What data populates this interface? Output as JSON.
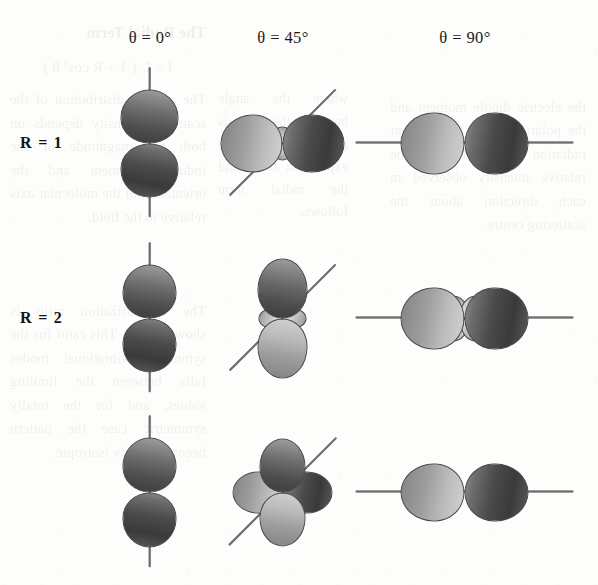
{
  "figure": {
    "kind": "radiation-pattern-grid",
    "grid": {
      "rows": 3,
      "columns": 3
    },
    "column_headers": [
      {
        "id": "theta-0",
        "text": "θ = 0°",
        "theta_deg": 0,
        "center_x": 150
      },
      {
        "id": "theta-45",
        "text": "θ = 45°",
        "theta_deg": 45,
        "center_x": 283
      },
      {
        "id": "theta-90",
        "text": "θ = 90°",
        "theta_deg": 90,
        "center_x": 465
      }
    ],
    "row_labels": [
      {
        "id": "row-r1",
        "text": "R = 1",
        "R": 1,
        "center_y": 143
      },
      {
        "id": "row-r2",
        "text": "R = 2",
        "R": 2,
        "center_y": 318
      },
      {
        "id": "row-r3",
        "text": "",
        "R": 3,
        "center_y": 492
      }
    ],
    "header_y": 28,
    "row_label_x": 20
  },
  "chart_data": {
    "type": "scatter",
    "xlabel": "θ (degrees)",
    "ylabel": "R",
    "grid": false,
    "legend": "none",
    "categories_x": [
      "θ = 0°",
      "θ = 45°",
      "θ = 90°"
    ],
    "categories_y": [
      "R = 1",
      "R = 2",
      "R = 3"
    ],
    "cells": [
      {
        "row": 1,
        "col": 1,
        "R": 1,
        "theta_deg": 0,
        "pattern": "vertical-dipole",
        "axis_angle_deg": 90,
        "axis_length": 150,
        "lobes": [
          {
            "angle_deg": 270,
            "length": 52,
            "width": 28,
            "shade": "dark"
          },
          {
            "angle_deg": 90,
            "length": 52,
            "width": 28,
            "shade": "dark-rev"
          }
        ]
      },
      {
        "row": 1,
        "col": 2,
        "R": 1,
        "theta_deg": 45,
        "pattern": "horizontal-dipole-with-minor-vertical-lobes",
        "axis_angle_deg": 45,
        "axis_length": 150,
        "lobes": [
          {
            "angle_deg": 180,
            "length": 60,
            "width": 28,
            "shade": "light"
          },
          {
            "angle_deg": 0,
            "length": 60,
            "width": 28,
            "shade": "dark"
          },
          {
            "angle_deg": 270,
            "length": 15,
            "width": 8,
            "shade": "pale"
          },
          {
            "angle_deg": 90,
            "length": 15,
            "width": 8,
            "shade": "pale"
          }
        ]
      },
      {
        "row": 1,
        "col": 3,
        "R": 1,
        "theta_deg": 90,
        "pattern": "horizontal-dipole",
        "axis_angle_deg": 0,
        "axis_length": 218,
        "lobes": [
          {
            "angle_deg": 180,
            "length": 62,
            "width": 30,
            "shade": "light"
          },
          {
            "angle_deg": 0,
            "length": 62,
            "width": 30,
            "shade": "dark"
          }
        ]
      },
      {
        "row": 2,
        "col": 1,
        "R": 2,
        "theta_deg": 0,
        "pattern": "vertical-dipole",
        "axis_angle_deg": 90,
        "axis_length": 150,
        "lobes": [
          {
            "angle_deg": 270,
            "length": 52,
            "width": 26,
            "shade": "dark"
          },
          {
            "angle_deg": 90,
            "length": 52,
            "width": 26,
            "shade": "dark-rev"
          }
        ]
      },
      {
        "row": 2,
        "col": 2,
        "R": 2,
        "theta_deg": 45,
        "pattern": "vertical-dipole-with-minor-horizontal-lobes",
        "axis_angle_deg": 45,
        "axis_length": 150,
        "lobes": [
          {
            "angle_deg": 270,
            "length": 58,
            "width": 24,
            "shade": "light"
          },
          {
            "angle_deg": 90,
            "length": 58,
            "width": 24,
            "shade": "dark-rev"
          },
          {
            "angle_deg": 180,
            "length": 22,
            "width": 9,
            "shade": "pale"
          },
          {
            "angle_deg": 0,
            "length": 22,
            "width": 9,
            "shade": "pale"
          }
        ]
      },
      {
        "row": 2,
        "col": 3,
        "R": 2,
        "theta_deg": 90,
        "pattern": "horizontal-dipole-with-four-minor-diagonal-lobes",
        "axis_angle_deg": 0,
        "axis_length": 218,
        "lobes": [
          {
            "angle_deg": 180,
            "length": 62,
            "width": 30,
            "shade": "light"
          },
          {
            "angle_deg": 0,
            "length": 62,
            "width": 30,
            "shade": "dark"
          },
          {
            "angle_deg": 235,
            "length": 24,
            "width": 9,
            "shade": "pale"
          },
          {
            "angle_deg": 305,
            "length": 24,
            "width": 9,
            "shade": "pale"
          },
          {
            "angle_deg": 125,
            "length": 24,
            "width": 9,
            "shade": "pale"
          },
          {
            "angle_deg": 55,
            "length": 24,
            "width": 9,
            "shade": "pale"
          }
        ]
      },
      {
        "row": 3,
        "col": 1,
        "R": 3,
        "theta_deg": 0,
        "pattern": "vertical-dipole",
        "axis_angle_deg": 90,
        "axis_length": 152,
        "lobes": [
          {
            "angle_deg": 270,
            "length": 53,
            "width": 26,
            "shade": "dark"
          },
          {
            "angle_deg": 90,
            "length": 53,
            "width": 26,
            "shade": "dark-rev"
          }
        ]
      },
      {
        "row": 3,
        "col": 2,
        "R": 3,
        "theta_deg": 45,
        "pattern": "four-lobe-cloverleaf",
        "axis_angle_deg": 45,
        "axis_length": 152,
        "lobes": [
          {
            "angle_deg": 270,
            "length": 52,
            "width": 22,
            "shade": "light"
          },
          {
            "angle_deg": 90,
            "length": 52,
            "width": 22,
            "shade": "dark-rev"
          },
          {
            "angle_deg": 180,
            "length": 48,
            "width": 20,
            "shade": "light"
          },
          {
            "angle_deg": 0,
            "length": 48,
            "width": 20,
            "shade": "dark"
          }
        ]
      },
      {
        "row": 3,
        "col": 3,
        "R": 3,
        "theta_deg": 90,
        "pattern": "horizontal-dipole",
        "axis_angle_deg": 0,
        "axis_length": 218,
        "lobes": [
          {
            "angle_deg": 180,
            "length": 62,
            "width": 28,
            "shade": "light"
          },
          {
            "angle_deg": 0,
            "length": 62,
            "width": 28,
            "shade": "dark"
          }
        ]
      }
    ]
  },
  "colors": {
    "page_background": "#fdfdfc",
    "text": "#1a1a1a",
    "axis_line": "#6e6e6e",
    "lobe_outline": "#4a4a4a",
    "lobe_dark": "#4a4a4a",
    "lobe_light": "#bdbdbd",
    "lobe_pale": "#cfcfcf",
    "showthrough": "#6a6a62"
  },
  "showthrough": {
    "note": "Faint mirrored text bleeding through from the reverse side of the scanned page; illegible in the screenshot.",
    "blocks": [
      {
        "id": "bleed-a",
        "text": "the electric dipole moment and the polarization of the incident radiation field determine the relative intensity observed in each direction about the scattering centre."
      },
      {
        "id": "bleed-b",
        "text": "where the angle between the axes is given by the expression above and the radial term follows."
      },
      {
        "id": "bleed-c",
        "heading": "The Radial Term",
        "equation": "I = I₀ ( 1 + R cos² θ )",
        "text": "The angular distribution of the scattered intensity depends on both the magnitude of the induced moment and the orientation of the molecular axis relative to the field."
      },
      {
        "id": "bleed-d",
        "heading": "",
        "text": "The depolarization ratio is shown below. This ratio for the symmetric vibrational modes falls between the limiting values, and for the totally symmetric case the pattern becomes nearly isotropic."
      }
    ]
  }
}
